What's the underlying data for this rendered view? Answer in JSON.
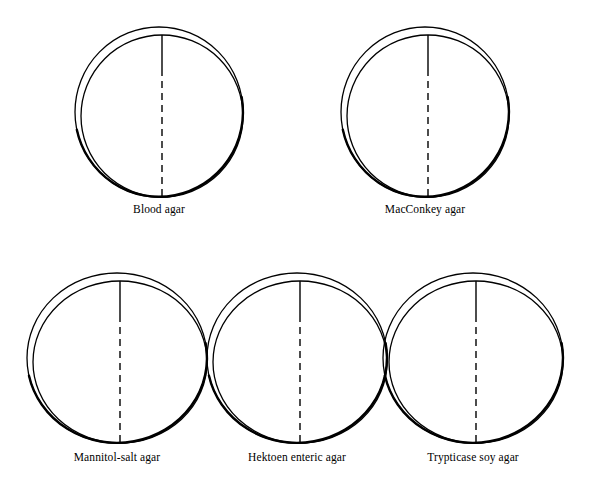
{
  "figure": {
    "background_color": "#ffffff",
    "stroke_color": "#000000",
    "rows": [
      {
        "name": "top-row",
        "dishes": [
          {
            "id": "blood-agar",
            "label": "Blood agar",
            "cx": 159,
            "cy": 112,
            "rx": 84,
            "ry": 85,
            "label_y": 204
          },
          {
            "id": "macconkey-agar",
            "label": "MacConkey agar",
            "cx": 425,
            "cy": 112,
            "rx": 84,
            "ry": 85,
            "label_y": 204
          }
        ]
      },
      {
        "name": "bottom-row",
        "dishes": [
          {
            "id": "mannitol-salt-agar",
            "label": "Mannitol-salt agar",
            "cx": 117,
            "cy": 358,
            "rx": 90,
            "ry": 85,
            "label_y": 452
          },
          {
            "id": "hektoen-enteric-agar",
            "label": "Hektoen enteric agar",
            "cx": 297,
            "cy": 358,
            "rx": 90,
            "ry": 85,
            "label_y": 452
          },
          {
            "id": "trypticase-soy-agar",
            "label": "Trypticase soy agar",
            "cx": 473,
            "cy": 358,
            "rx": 90,
            "ry": 85,
            "label_y": 452
          }
        ]
      }
    ],
    "divider": {
      "solid_fraction": 0.21,
      "dash_pattern": "7 5"
    },
    "geometry": {
      "lid_offset_x": 3,
      "lid_offset_y": 4,
      "thin_stroke_width": 1.3,
      "thick_stroke_width": 2.4,
      "divider_stroke_width": 1.4
    }
  }
}
